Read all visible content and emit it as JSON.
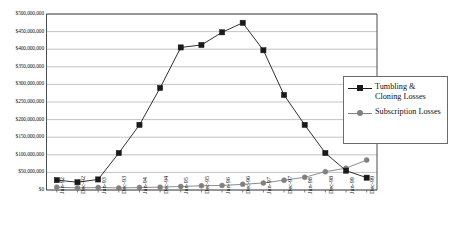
{
  "chart_data": {
    "type": "line",
    "title": "",
    "xlabel": "",
    "ylabel": "",
    "ylim": [
      0,
      500000000
    ],
    "ytick_step": 50000000,
    "grid": true,
    "legend_position": "right-inside",
    "categories": [
      "Jun-92",
      "Dec-92",
      "Jun-93",
      "Dec-93",
      "Jun-94",
      "Dec-94",
      "Jun-95",
      "Dec-95",
      "Jun-96",
      "Dec-96",
      "Jun-97",
      "Dec-97",
      "Jun-98",
      "Dec-98",
      "Jun-99",
      "Dec-99"
    ],
    "ytick_labels": [
      "$500,000,000",
      "$450,000,000",
      "$400,000,000",
      "$350,000,000",
      "$300,000,000",
      "$250,000,000",
      "$200,000,000",
      "$150,000,000",
      "$100,000,000",
      "$50,000,000",
      "$0"
    ],
    "ytick_values": [
      500000000,
      450000000,
      400000000,
      350000000,
      300000000,
      250000000,
      200000000,
      150000000,
      100000000,
      50000000,
      0
    ],
    "series": [
      {
        "name": "Tumbling & Cloning Losses",
        "marker": "square",
        "color": "#1a1a1a",
        "values": [
          28000000,
          22000000,
          30000000,
          105000000,
          185000000,
          290000000,
          405000000,
          412000000,
          448000000,
          475000000,
          397000000,
          270000000,
          185000000,
          105000000,
          55000000,
          35000000
        ]
      },
      {
        "name": "Subscription Losses",
        "marker": "circle",
        "color": "#808080",
        "values": [
          8000000,
          6000000,
          7000000,
          6000000,
          7000000,
          8000000,
          10000000,
          12000000,
          13000000,
          16000000,
          20000000,
          28000000,
          36000000,
          52000000,
          62000000,
          85000000
        ]
      }
    ]
  },
  "legend": {
    "entries": [
      {
        "label": "Tumbling & Cloning Losses",
        "marker": "square",
        "color": "#1a1a1a"
      },
      {
        "label": "Subscription Losses",
        "marker": "circle",
        "color": "#808080"
      }
    ]
  },
  "colors": {
    "series_1": "#1a1a1a",
    "series_2": "#808080",
    "gridline": "#a9a9a9",
    "frame": "#4d4d4d",
    "background": "#ffffff"
  }
}
